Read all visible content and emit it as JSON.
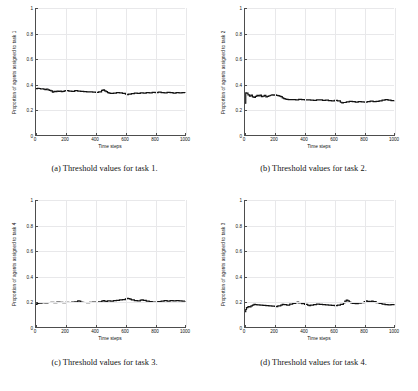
{
  "figure": {
    "layout": "2x2 subplot grid",
    "background": "#ffffff",
    "line_color": "#111111",
    "grid_color": "#e8e8ea",
    "axis_color": "#4d4d4d"
  },
  "subfigures": [
    {
      "caption": "(a) Threshold values for task 1."
    },
    {
      "caption": "(b) Threshold values for task 2."
    },
    {
      "caption": "(c) Threshold values for task 3."
    },
    {
      "caption": "(d) Threshold values for task 4."
    }
  ],
  "chart_data": [
    {
      "type": "line",
      "title": "(a) Threshold values for task 1.",
      "xlabel": "Time steps",
      "ylabel": "Proportion of agents assigned to task 1",
      "xlim": [
        0,
        1000
      ],
      "ylim": [
        0,
        1
      ],
      "xticks": [
        0,
        200,
        400,
        600,
        800,
        1000
      ],
      "yticks": [
        0,
        0.2,
        0.4,
        0.6,
        0.8,
        1
      ],
      "ytick_labels": [
        "0",
        "0.2",
        "0.4",
        "0.6",
        "0.8",
        "1"
      ],
      "grid": true,
      "legend": null,
      "series": [
        {
          "name": "task 1 proportion",
          "x": [
            0,
            10,
            20,
            30,
            40,
            50,
            60,
            70,
            80,
            90,
            100,
            110,
            120,
            130,
            140,
            150,
            160,
            170,
            180,
            190,
            200,
            220,
            240,
            260,
            280,
            300,
            320,
            340,
            360,
            380,
            400,
            420,
            440,
            450,
            460,
            470,
            480,
            490,
            500,
            520,
            540,
            560,
            580,
            600,
            610,
            620,
            640,
            660,
            680,
            700,
            720,
            740,
            760,
            780,
            800,
            820,
            840,
            860,
            880,
            900,
            920,
            940,
            960,
            980,
            1000
          ],
          "y": [
            0.365,
            0.368,
            0.366,
            0.362,
            0.364,
            0.361,
            0.358,
            0.362,
            0.356,
            0.352,
            0.348,
            0.338,
            0.344,
            0.342,
            0.346,
            0.343,
            0.345,
            0.341,
            0.343,
            0.347,
            0.349,
            0.346,
            0.344,
            0.35,
            0.345,
            0.343,
            0.341,
            0.339,
            0.34,
            0.337,
            0.336,
            0.34,
            0.351,
            0.356,
            0.348,
            0.342,
            0.334,
            0.33,
            0.327,
            0.33,
            0.333,
            0.331,
            0.328,
            0.321,
            0.317,
            0.322,
            0.326,
            0.33,
            0.327,
            0.332,
            0.329,
            0.334,
            0.331,
            0.336,
            0.333,
            0.337,
            0.334,
            0.331,
            0.336,
            0.333,
            0.33,
            0.334,
            0.332,
            0.334,
            0.333
          ]
        }
      ]
    },
    {
      "type": "line",
      "title": "(b) Threshold values for task 2.",
      "xlabel": "Time steps",
      "ylabel": "Proportion of agents assigned to task 2",
      "xlim": [
        0,
        1000
      ],
      "ylim": [
        0,
        1
      ],
      "xticks": [
        0,
        200,
        400,
        600,
        800,
        1000
      ],
      "yticks": [
        0,
        0.2,
        0.4,
        0.6,
        0.8,
        1
      ],
      "ytick_labels": [
        "0",
        "0.2",
        "0.4",
        "0.6",
        "0.8",
        "1"
      ],
      "grid": true,
      "legend": null,
      "series": [
        {
          "name": "task 2 proportion",
          "x": [
            0,
            5,
            10,
            20,
            30,
            40,
            50,
            60,
            70,
            80,
            90,
            100,
            110,
            120,
            130,
            140,
            150,
            160,
            170,
            180,
            190,
            200,
            210,
            220,
            230,
            240,
            250,
            260,
            270,
            280,
            290,
            300,
            320,
            340,
            360,
            380,
            400,
            420,
            440,
            460,
            480,
            500,
            520,
            540,
            560,
            580,
            600,
            620,
            640,
            650,
            660,
            680,
            700,
            720,
            740,
            760,
            780,
            800,
            820,
            840,
            860,
            880,
            900,
            920,
            940,
            960,
            980,
            1000
          ],
          "y": [
            0.25,
            0.332,
            0.33,
            0.316,
            0.306,
            0.314,
            0.3,
            0.296,
            0.304,
            0.312,
            0.308,
            0.314,
            0.302,
            0.306,
            0.312,
            0.3,
            0.304,
            0.309,
            0.313,
            0.316,
            0.314,
            0.316,
            0.312,
            0.31,
            0.306,
            0.302,
            0.292,
            0.286,
            0.283,
            0.281,
            0.279,
            0.278,
            0.279,
            0.277,
            0.28,
            0.278,
            0.276,
            0.277,
            0.275,
            0.273,
            0.277,
            0.276,
            0.272,
            0.274,
            0.271,
            0.269,
            0.272,
            0.268,
            0.258,
            0.253,
            0.256,
            0.261,
            0.264,
            0.262,
            0.259,
            0.263,
            0.261,
            0.258,
            0.263,
            0.266,
            0.262,
            0.265,
            0.269,
            0.275,
            0.278,
            0.274,
            0.271,
            0.272
          ]
        }
      ]
    },
    {
      "type": "line",
      "title": "(c) Threshold values for task 3.",
      "xlabel": "Time steps",
      "ylabel": "Proportion of agents assigned to task 4",
      "xlim": [
        0,
        1000
      ],
      "ylim": [
        0,
        1
      ],
      "xticks": [
        0,
        200,
        400,
        600,
        800,
        1000
      ],
      "yticks": [
        0,
        0.2,
        0.4,
        0.6,
        0.8,
        1
      ],
      "ytick_labels": [
        "0",
        "0.2",
        "0.4",
        "0.6",
        "0.8",
        "1"
      ],
      "grid": true,
      "legend": null,
      "series": [
        {
          "name": "task 4 proportion",
          "x": [
            0,
            5,
            10,
            20,
            30,
            40,
            60,
            80,
            100,
            120,
            140,
            160,
            180,
            200,
            220,
            240,
            260,
            280,
            290,
            300,
            310,
            320,
            340,
            360,
            380,
            400,
            420,
            440,
            450,
            460,
            470,
            480,
            500,
            520,
            540,
            560,
            580,
            600,
            610,
            620,
            630,
            640,
            660,
            680,
            700,
            710,
            720,
            740,
            760,
            780,
            800,
            810,
            820,
            840,
            860,
            880,
            900,
            920,
            940,
            960,
            980,
            1000
          ],
          "y": [
            0.178,
            0.182,
            0.186,
            0.19,
            0.188,
            0.192,
            0.19,
            0.193,
            0.194,
            0.192,
            0.196,
            0.194,
            0.192,
            0.195,
            0.193,
            0.196,
            0.198,
            0.205,
            0.203,
            0.197,
            0.195,
            0.193,
            0.192,
            0.194,
            0.196,
            0.193,
            0.198,
            0.204,
            0.207,
            0.203,
            0.2,
            0.206,
            0.204,
            0.207,
            0.21,
            0.213,
            0.216,
            0.222,
            0.226,
            0.224,
            0.22,
            0.214,
            0.208,
            0.206,
            0.212,
            0.214,
            0.21,
            0.204,
            0.2,
            0.196,
            0.194,
            0.198,
            0.2,
            0.203,
            0.207,
            0.204,
            0.208,
            0.205,
            0.208,
            0.206,
            0.204,
            0.205
          ]
        }
      ]
    },
    {
      "type": "line",
      "title": "(d) Threshold values for task 4.",
      "xlabel": "Time steps",
      "ylabel": "Proportion of agents assigned to task 3",
      "xlim": [
        0,
        1000
      ],
      "ylim": [
        0,
        1
      ],
      "xticks": [
        0,
        200,
        400,
        600,
        800,
        1000
      ],
      "yticks": [
        0,
        0.2,
        0.4,
        0.6,
        0.8,
        1
      ],
      "ytick_labels": [
        "0",
        "0.2",
        "0.4",
        "0.6",
        "0.8",
        "1"
      ],
      "grid": true,
      "legend": null,
      "series": [
        {
          "name": "task 3 proportion",
          "x": [
            0,
            5,
            10,
            20,
            30,
            40,
            50,
            60,
            70,
            80,
            100,
            120,
            140,
            160,
            180,
            200,
            210,
            220,
            240,
            250,
            260,
            280,
            300,
            320,
            340,
            350,
            360,
            380,
            400,
            420,
            430,
            440,
            460,
            480,
            500,
            520,
            540,
            560,
            580,
            600,
            620,
            640,
            660,
            670,
            680,
            690,
            700,
            710,
            720,
            740,
            760,
            780,
            800,
            810,
            820,
            840,
            850,
            860,
            880,
            900,
            920,
            940,
            960,
            980,
            1000
          ],
          "y": [
            0.12,
            0.138,
            0.152,
            0.16,
            0.158,
            0.166,
            0.172,
            0.178,
            0.176,
            0.174,
            0.172,
            0.17,
            0.168,
            0.166,
            0.164,
            0.162,
            0.16,
            0.166,
            0.172,
            0.178,
            0.176,
            0.172,
            0.18,
            0.186,
            0.192,
            0.196,
            0.19,
            0.184,
            0.178,
            0.172,
            0.168,
            0.172,
            0.176,
            0.18,
            0.178,
            0.176,
            0.174,
            0.172,
            0.17,
            0.168,
            0.172,
            0.178,
            0.19,
            0.204,
            0.212,
            0.206,
            0.196,
            0.19,
            0.186,
            0.184,
            0.188,
            0.192,
            0.2,
            0.206,
            0.202,
            0.198,
            0.204,
            0.2,
            0.192,
            0.186,
            0.18,
            0.176,
            0.174,
            0.176,
            0.172
          ]
        }
      ]
    }
  ]
}
